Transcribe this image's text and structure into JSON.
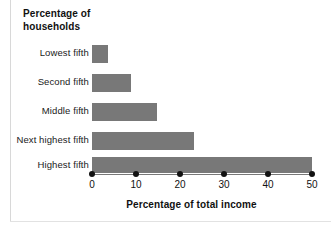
{
  "chart_data": {
    "type": "bar",
    "orientation": "horizontal",
    "title": "Percentage of households",
    "title_line1": "Percentage of",
    "title_line2": "households",
    "xlabel": "Percentage of total income",
    "ylabel": "",
    "categories": [
      "Lowest fifth",
      "Second fifth",
      "Middle fifth",
      "Next highest fifth",
      "Highest fifth"
    ],
    "values": [
      3.6,
      8.9,
      14.8,
      23.0,
      49.7
    ],
    "xlim": [
      0,
      50
    ],
    "xticks": [
      0,
      10,
      20,
      30,
      40,
      50
    ],
    "xtick_labels": [
      "0",
      "10",
      "20",
      "30",
      "40",
      "50"
    ],
    "grid": false,
    "legend": false,
    "bar_color": "#787878",
    "tick_marker": "filled-circle",
    "background": "#ffffff"
  }
}
